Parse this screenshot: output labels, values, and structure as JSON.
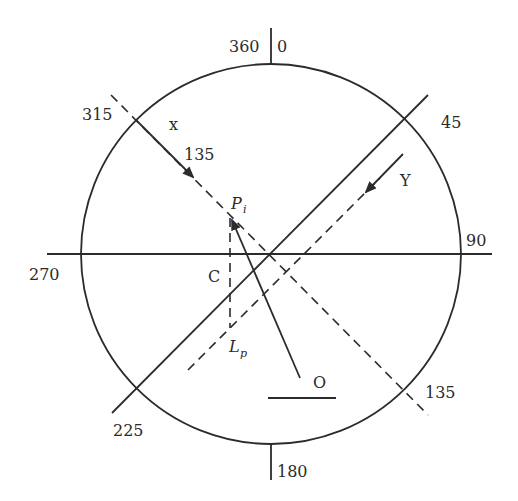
{
  "diagram": {
    "type": "compass-circle-construction",
    "colors": {
      "stroke": "#2b2b2b",
      "background": "#ffffff"
    },
    "bearing_labels": {
      "top_left": "360",
      "top_right": "0",
      "ne": "45",
      "east": "90",
      "se": "135",
      "south": "180",
      "sw": "225",
      "west": "270",
      "nw": "315"
    },
    "axis_labels": {
      "x": "x",
      "x_arrow_value": "135",
      "y": "Y"
    },
    "point_labels": {
      "p_main": "P",
      "p_sub": "i",
      "c": "C",
      "l_main": "L",
      "l_sub": "p",
      "o": "O"
    }
  }
}
